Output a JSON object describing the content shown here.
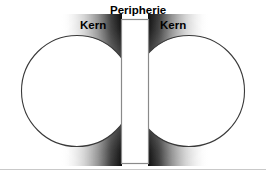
{
  "figure": {
    "background_color": "#ffffff",
    "width": 266,
    "height": 170,
    "labels": {
      "kern_left": "Kern",
      "peripherie": "Peripherie",
      "kern_right": "Kern"
    },
    "shapes": {
      "left_circle": {
        "name": "Kern",
        "cx": 77,
        "cy": 91,
        "r": 55.5,
        "fill": "#ffffff",
        "stroke": "#3a3a3a"
      },
      "right_circle": {
        "name": "Kern",
        "cx": 189,
        "cy": 91,
        "r": 55.5,
        "fill": "#ffffff",
        "stroke": "#3a3a3a"
      },
      "center_rectangle": {
        "name": "Peripherie",
        "x": 121,
        "y": 19,
        "width": 27,
        "height": 145,
        "fill": "#ffffff",
        "stroke": "#808080"
      },
      "shadow": {
        "color": "#000000",
        "description": "dunkler Schatten zwischen Kern und Peripherie"
      },
      "baseline": {
        "color": "#bdbdbd",
        "y": 169
      }
    }
  }
}
